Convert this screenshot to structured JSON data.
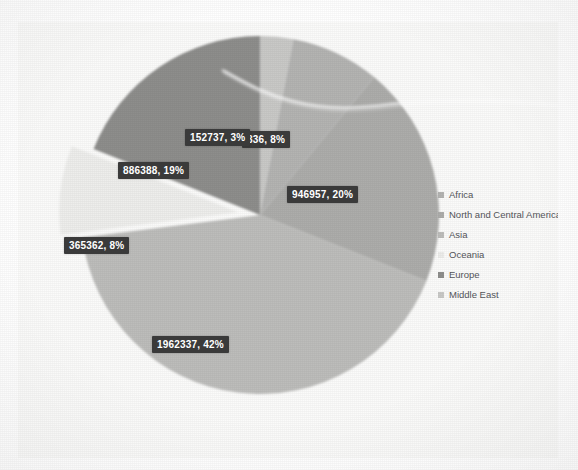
{
  "chart_data": {
    "type": "pie",
    "title": "",
    "legend_position": "right",
    "grid": false,
    "categories": [
      "Africa",
      "North and Central America",
      "Asia",
      "Oceania",
      "Europe",
      "Middle East"
    ],
    "labels": [
      "152737, 3%",
      "836, 8%",
      "946957, 20%",
      "1962337, 42%",
      "365362, 8%",
      "886388, 19%"
    ],
    "values": [
      152737,
      836,
      946957,
      1962337,
      365362,
      886388
    ],
    "percents": [
      3,
      8,
      20,
      42,
      8,
      19
    ],
    "slices": [
      {
        "value": "152737",
        "percent": "3%",
        "label": "152737, 3%",
        "color": "#c9c9c7"
      },
      {
        "value": "836",
        "percent": "8%",
        "label": "836, 8%",
        "color": "#b4b4b2"
      },
      {
        "value": "946957",
        "percent": "20%",
        "label": "946957, 20%",
        "color": "#adadab"
      },
      {
        "value": "1962337",
        "percent": "42%",
        "label": "1962337, 42%",
        "color": "#bdbdbb"
      },
      {
        "value": "365362",
        "percent": "8%",
        "label": "365362, 8%",
        "color": "#eeeeec"
      },
      {
        "value": "886388",
        "percent": "19%",
        "label": "886388, 19%",
        "color": "#8e8e8c"
      }
    ]
  },
  "legend": {
    "items": [
      {
        "label": "Africa",
        "color": "#b4b4b2"
      },
      {
        "label": "North and Central America",
        "color": "#adadab"
      },
      {
        "label": "Asia",
        "color": "#bdbdbb"
      },
      {
        "label": "Oceania",
        "color": "#ededeb"
      },
      {
        "label": "Europe",
        "color": "#8e8e8c"
      },
      {
        "label": "Middle East",
        "color": "#c9c9c7"
      }
    ]
  },
  "colors": {
    "panel_background": "#fbfbfa",
    "page_background": "#ffffff",
    "label_background": "#3a3a3a",
    "label_text": "#ffffff",
    "legend_text": "#55565a"
  }
}
